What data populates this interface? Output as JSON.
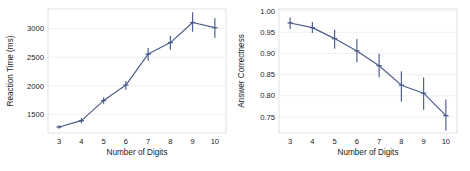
{
  "figure": {
    "background": "#ffffff",
    "line_color": "#4c5b8c",
    "grid_color": "#eceef2",
    "frame_color": "#d8dade",
    "text_color": "#1b1b1b",
    "panel_count": 2
  },
  "chart_data": [
    {
      "type": "line",
      "panel": "left",
      "title": "",
      "xlabel": "Number of Digits",
      "ylabel": "Reaction Time (ms)",
      "x": [
        3,
        4,
        5,
        6,
        7,
        8,
        9,
        10
      ],
      "xticklabels": [
        "3",
        "4",
        "5",
        "6",
        "7",
        "8",
        "9",
        "10"
      ],
      "values": [
        1285,
        1395,
        1745,
        2015,
        2555,
        2755,
        3105,
        3015
      ],
      "error_low": [
        1255,
        1350,
        1690,
        1935,
        2440,
        2630,
        2945,
        2840
      ],
      "error_high": [
        1315,
        1440,
        1800,
        2085,
        2660,
        2870,
        3285,
        3180
      ],
      "yticks": [
        1500,
        2000,
        2500,
        3000
      ],
      "yticklabels": [
        "1500",
        "2000",
        "2500",
        "3000"
      ],
      "xlim": [
        2.5,
        10.5
      ],
      "ylim": [
        1180,
        3340
      ],
      "grid": true,
      "grid_axis": "y",
      "legend": "none",
      "marker": "plus-errorbar",
      "series": [
        {
          "name": "Reaction Time (ms)",
          "values": [
            1285,
            1395,
            1745,
            2015,
            2555,
            2755,
            3105,
            3015
          ]
        }
      ]
    },
    {
      "type": "line",
      "panel": "right",
      "title": "",
      "xlabel": "Number of Digits",
      "ylabel": "Answer Correctness",
      "x": [
        3,
        4,
        5,
        6,
        7,
        8,
        9,
        10
      ],
      "xticklabels": [
        "3",
        "4",
        "5",
        "6",
        "7",
        "8",
        "9",
        "10"
      ],
      "values": [
        0.972,
        0.961,
        0.935,
        0.906,
        0.871,
        0.825,
        0.806,
        0.753
      ],
      "error_low": [
        0.958,
        0.948,
        0.911,
        0.879,
        0.844,
        0.786,
        0.767,
        0.718
      ],
      "error_high": [
        0.985,
        0.974,
        0.956,
        0.934,
        0.899,
        0.858,
        0.843,
        0.791
      ],
      "yticks": [
        0.75,
        0.8,
        0.85,
        0.9,
        0.95,
        1.0
      ],
      "yticklabels": [
        "0.75",
        "0.80",
        "0.85",
        "0.90",
        "0.95",
        "1.00"
      ],
      "xlim": [
        2.5,
        10.5
      ],
      "ylim": [
        0.712,
        1.005
      ],
      "grid": true,
      "grid_axis": "y",
      "legend": "none",
      "marker": "plus-errorbar",
      "series": [
        {
          "name": "Answer Correctness",
          "values": [
            0.972,
            0.961,
            0.935,
            0.906,
            0.871,
            0.825,
            0.806,
            0.753
          ]
        }
      ]
    }
  ]
}
